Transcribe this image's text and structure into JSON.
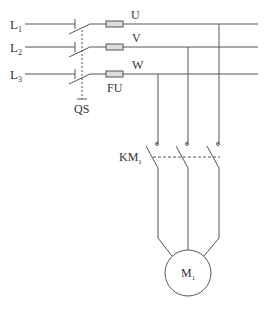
{
  "diagram": {
    "title": "",
    "type": "three-phase motor control circuit",
    "colors": {
      "line": "#555555",
      "text": "#333333",
      "background": "#ffffff",
      "fuse_fill": "#dddddd"
    },
    "supply_lines": [
      {
        "label": "L",
        "sub": "1"
      },
      {
        "label": "L",
        "sub": "2"
      },
      {
        "label": "L",
        "sub": "3"
      }
    ],
    "bus_labels": [
      "U",
      "V",
      "W"
    ],
    "switch": {
      "label": "QS"
    },
    "fuse": {
      "label": "FU"
    },
    "contactor": {
      "label": "KM",
      "sub": "1"
    },
    "motor": {
      "label": "M",
      "sub": "1"
    }
  }
}
